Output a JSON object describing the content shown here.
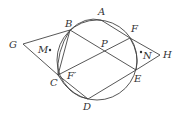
{
  "diagram": {
    "type": "geometry",
    "circle": {
      "cx": 97,
      "cy": 60,
      "r": 40
    },
    "points": {
      "A": {
        "label": "A",
        "x": 101,
        "y": 20
      },
      "B": {
        "label": "B",
        "x": 70,
        "y": 30
      },
      "C": {
        "label": "C",
        "x": 58,
        "y": 75
      },
      "D": {
        "label": "D",
        "x": 88,
        "y": 99
      },
      "E": {
        "label": "E",
        "x": 136,
        "y": 70
      },
      "F": {
        "label": "F",
        "x": 130,
        "y": 38
      },
      "G": {
        "label": "G",
        "x": 23,
        "y": 44
      },
      "H": {
        "label": "H",
        "x": 160,
        "y": 55
      },
      "P": {
        "label": "P",
        "x": 105,
        "y": 52
      },
      "M": {
        "label": "M",
        "x": 50,
        "y": 50
      },
      "N": {
        "label": "N",
        "x": 141,
        "y": 52
      },
      "Fp": {
        "label": "F′"
      }
    },
    "segments": [
      "GB",
      "GC",
      "BC",
      "BE",
      "CF",
      "CE"
    ]
  }
}
